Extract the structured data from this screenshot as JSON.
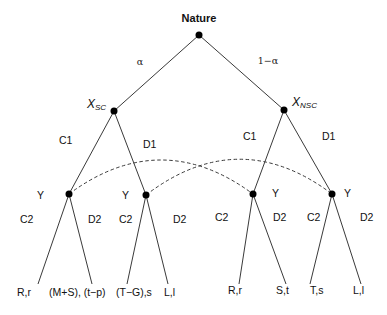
{
  "root": {
    "label": "Nature",
    "prob_left": "α",
    "prob_right": "1−α"
  },
  "player_x": {
    "left": {
      "name": "X",
      "sub": "SC"
    },
    "right": {
      "name": "X",
      "sub": "NSC"
    }
  },
  "moves_x": {
    "cooperate": "C1",
    "defect": "D1"
  },
  "player_y": {
    "name": "Y",
    "cooperate": "C2",
    "defect": "D2"
  },
  "payoffs": [
    "R,r",
    "(M+S), (t−p)",
    "(T−G),s",
    "L,l",
    "R,r",
    "S,t",
    "T,s",
    "L,l"
  ],
  "information_sets": [
    {
      "from": "Y after SC-C1",
      "to": "Y after NSC-C1"
    },
    {
      "from": "Y after SC-D1",
      "to": "Y after NSC-D1"
    }
  ]
}
